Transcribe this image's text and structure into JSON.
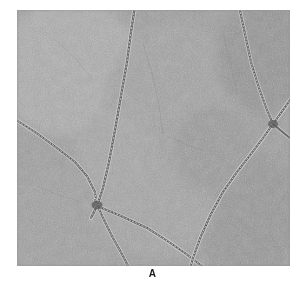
{
  "figure": {
    "kind": "electron-micrograph",
    "panel_label": "A",
    "background_color": "#ffffff"
  },
  "micrograph": {
    "alt_text": "Electron micrograph showing crossing beaded filaments on a grainy stained background",
    "frame": {
      "x": 17,
      "y": 10,
      "width": 273,
      "height": 256
    },
    "tones": {
      "background_mid_gray": "#9c9c9c",
      "background_light_gray": "#ababab",
      "background_dark_gray": "#8a8a8a",
      "filament_dark": "#3a3a3a",
      "filament_highlight": "#d8d8d8"
    },
    "field_patches": [
      {
        "name": "upper-left-lighter-field",
        "x": 0,
        "y": 0,
        "width": 110,
        "height": 130,
        "tone": "#aeaeae"
      },
      {
        "name": "central-field",
        "x": 100,
        "y": 20,
        "width": 120,
        "height": 200,
        "tone": "#a2a2a2"
      },
      {
        "name": "right-field",
        "x": 215,
        "y": 0,
        "width": 60,
        "height": 120,
        "tone": "#979797"
      },
      {
        "name": "lower-left-field",
        "x": 0,
        "y": 170,
        "width": 110,
        "height": 90,
        "tone": "#9f9f9f"
      },
      {
        "name": "lower-right-field",
        "x": 190,
        "y": 150,
        "width": 90,
        "height": 110,
        "tone": "#989898"
      }
    ],
    "filaments": [
      {
        "name": "filament-top-center-vertical",
        "path": "M 118 -4 L 114 22 L 110 52 L 104 86 L 98 120 L 92 152 L 86 178 L 80 196 L 74 208",
        "width": 2.1
      },
      {
        "name": "filament-left-diagonal",
        "path": "M -4 108 L 18 122 L 40 138 L 58 152 L 70 166 L 78 182 L 80 196",
        "width": 2.0
      },
      {
        "name": "filament-junction-descender",
        "path": "M 78 190 L 86 208 L 96 228 L 106 246 L 114 262",
        "width": 2.0
      },
      {
        "name": "filament-junction-to-lower-right",
        "path": "M 80 196 L 104 206 L 130 218 L 152 232 L 172 246 L 190 260",
        "width": 2.0
      },
      {
        "name": "filament-upper-right-descending",
        "path": "M 222 -4 L 228 24 L 234 52 L 242 78 L 250 100 L 256 114",
        "width": 2.0
      },
      {
        "name": "filament-right-crossing-upward",
        "path": "M 276 86 L 266 100 L 256 114 L 246 128 L 234 144 L 220 162 L 206 182 L 194 204 L 184 226 L 176 248 L 172 262",
        "width": 2.0
      },
      {
        "name": "filament-right-edge-short",
        "path": "M 256 114 L 268 124 L 278 132 L 288 140",
        "width": 1.8
      }
    ],
    "noise": {
      "grain_description": "fine high-frequency speckle, stain granularity",
      "speckle_count": 2600
    }
  }
}
